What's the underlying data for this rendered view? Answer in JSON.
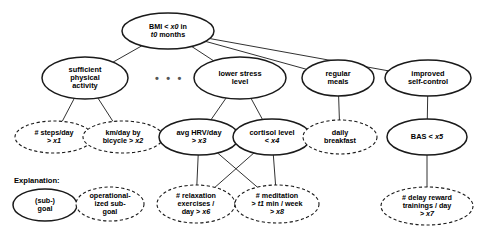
{
  "diagram": {
    "title_text": "Explanation:",
    "ellipsis": "• • •",
    "colors": {
      "stroke": "#1a1a1a",
      "text": "#000000",
      "background": "#ffffff",
      "dots": "#555555"
    },
    "nodes": [
      {
        "id": "root",
        "label": "BMI < x0 in\nt0 months",
        "style": "solid",
        "role": "goal",
        "cx": 168,
        "cy": 31,
        "rx": 46,
        "ry": 18
      },
      {
        "id": "phys",
        "label": "sufficient\nphysical\nactivity",
        "style": "solid",
        "role": "goal",
        "cx": 85,
        "cy": 78,
        "rx": 43,
        "ry": 21
      },
      {
        "id": "stress",
        "label": "lower stress\nlevel",
        "style": "solid",
        "role": "goal",
        "cx": 240,
        "cy": 78,
        "rx": 46,
        "ry": 21
      },
      {
        "id": "meals",
        "label": "regular\nmeals",
        "style": "solid",
        "role": "goal",
        "cx": 338,
        "cy": 78,
        "rx": 36,
        "ry": 18
      },
      {
        "id": "selfctrl",
        "label": "improved\nself-control",
        "style": "solid",
        "role": "goal",
        "cx": 428,
        "cy": 78,
        "rx": 43,
        "ry": 18
      },
      {
        "id": "steps",
        "label": "# steps/day\n> x1",
        "style": "dashed",
        "role": "operationalized",
        "cx": 54,
        "cy": 137,
        "rx": 39,
        "ry": 16
      },
      {
        "id": "bicycle",
        "label": "km/day by\nbicycle > x2",
        "style": "dashed",
        "role": "operationalized",
        "cx": 123,
        "cy": 137,
        "rx": 40,
        "ry": 16
      },
      {
        "id": "hrv",
        "label": "avg HRV/day\n> x3",
        "style": "solid",
        "role": "goal",
        "cx": 199,
        "cy": 137,
        "rx": 40,
        "ry": 18
      },
      {
        "id": "cortisol",
        "label": "cortisol level\n< x4",
        "style": "solid",
        "role": "goal",
        "cx": 272,
        "cy": 137,
        "rx": 39,
        "ry": 18
      },
      {
        "id": "breakfast",
        "label": "daily\nbreakfast",
        "style": "dashed",
        "role": "operationalized",
        "cx": 340,
        "cy": 137,
        "rx": 37,
        "ry": 17
      },
      {
        "id": "bas",
        "label": "BAS < x5",
        "style": "solid",
        "role": "goal",
        "cx": 427,
        "cy": 137,
        "rx": 40,
        "ry": 18
      },
      {
        "id": "relax",
        "label": "# relaxation\nexercises /\nday > x6",
        "style": "dashed",
        "role": "operationalized",
        "cx": 196,
        "cy": 204,
        "rx": 39,
        "ry": 19
      },
      {
        "id": "medit",
        "label": "# meditation\n> t1 min / week\n> x8",
        "style": "dashed",
        "role": "operationalized",
        "cx": 277,
        "cy": 204,
        "rx": 42,
        "ry": 19
      },
      {
        "id": "delay",
        "label": "# delay reward\ntrainings / day\n> x7",
        "style": "dashed",
        "role": "operationalized",
        "cx": 427,
        "cy": 206,
        "rx": 46,
        "ry": 19
      },
      {
        "id": "legend-goal",
        "label": "(sub-)\ngoal",
        "style": "solid",
        "role": "legend-goal",
        "cx": 45,
        "cy": 205,
        "rx": 32,
        "ry": 16
      },
      {
        "id": "legend-op",
        "label": "operational-\nized sub-\ngoal",
        "style": "dashed",
        "role": "legend-operationalized",
        "cx": 110,
        "cy": 204,
        "rx": 34,
        "ry": 17
      }
    ],
    "edges": [
      {
        "from": "root",
        "to": "phys"
      },
      {
        "from": "root",
        "to": "stress"
      },
      {
        "from": "root",
        "to": "meals"
      },
      {
        "from": "root",
        "to": "selfctrl"
      },
      {
        "from": "phys",
        "to": "steps"
      },
      {
        "from": "phys",
        "to": "bicycle"
      },
      {
        "from": "stress",
        "to": "hrv"
      },
      {
        "from": "stress",
        "to": "cortisol"
      },
      {
        "from": "hrv",
        "to": "relax"
      },
      {
        "from": "hrv",
        "to": "medit"
      },
      {
        "from": "cortisol",
        "to": "relax"
      },
      {
        "from": "cortisol",
        "to": "medit"
      },
      {
        "from": "meals",
        "to": "breakfast"
      },
      {
        "from": "selfctrl",
        "to": "bas"
      },
      {
        "from": "bas",
        "to": "delay"
      }
    ],
    "ellipsis_pos": {
      "x": 155,
      "y": 72
    },
    "legend_title_pos": {
      "x": 14,
      "y": 176
    }
  }
}
